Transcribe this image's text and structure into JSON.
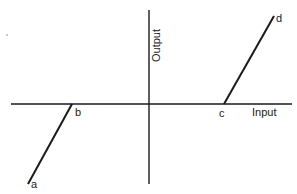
{
  "diagram": {
    "type": "input-output characteristic (dead zone)",
    "axes": {
      "x_label": "Input",
      "y_label": "Output"
    },
    "points": [
      {
        "id": "a",
        "label": "a"
      },
      {
        "id": "b",
        "label": "b"
      },
      {
        "id": "c",
        "label": "c"
      },
      {
        "id": "d",
        "label": "d"
      }
    ],
    "segments": [
      {
        "from": "a",
        "to": "b"
      },
      {
        "from": "c",
        "to": "d"
      }
    ],
    "colors": {
      "line": "#1a1a1a",
      "background": "#ffffff"
    }
  }
}
